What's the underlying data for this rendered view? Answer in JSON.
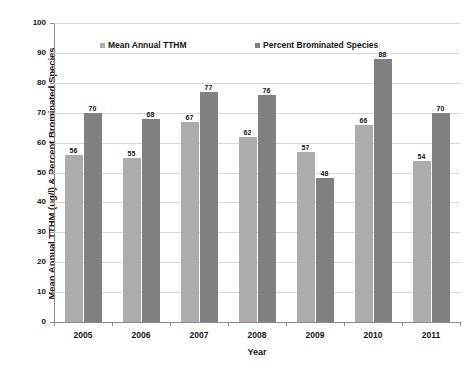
{
  "chart_data": {
    "type": "bar",
    "title": "",
    "xlabel": "Year",
    "ylabel": "Mean Annual TTHM (ug/l) & Percent Brominated Species",
    "categories": [
      "2005",
      "2006",
      "2007",
      "2008",
      "2009",
      "2010",
      "2011"
    ],
    "series": [
      {
        "name": "Mean Annual  TTHM",
        "color": "#ACACAC",
        "values": [
          56,
          55,
          67,
          62,
          57,
          66,
          54
        ]
      },
      {
        "name": "Percent Brominated Species",
        "color": "#808080",
        "values": [
          70,
          68,
          77,
          76,
          48,
          88,
          70
        ]
      }
    ],
    "ylim": [
      0,
      100
    ],
    "ytick_step": 10,
    "yticks": [
      0,
      10,
      20,
      30,
      40,
      50,
      60,
      70,
      80,
      90,
      100
    ],
    "grid": "horizontal",
    "legend_position": "top-inside",
    "data_labels": true,
    "axis_color": "#8a8a8a",
    "gridline_color": "#d9d9d9",
    "background": "#ffffff"
  }
}
